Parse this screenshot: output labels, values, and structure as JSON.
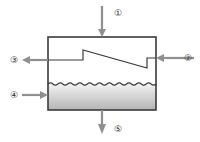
{
  "diagram": {
    "type": "process-flow-separator-vessel",
    "vessel": {
      "shape": "rectangle",
      "x": 48,
      "y": 37,
      "width": 108,
      "height": 73,
      "outline_color": "#3a3a3a",
      "outline_width": 1.6,
      "vapor_fill": "#ffffff",
      "liquid_fill_top": "#f2f2f2",
      "liquid_fill_bottom": "#b4b4b4"
    },
    "internal_baffle": {
      "name": "sloped-step-baffle",
      "color": "#3a3a3a",
      "width": 1.2,
      "points": "48,60 83,60 83,50 147,68 147,58 156,58"
    },
    "liquid_surface": {
      "name": "wavy-liquid-level-line",
      "color": "#3a3a3a",
      "y": 84,
      "wave_cycles": 11,
      "amplitude": 2.2
    },
    "arrow_color": "#8f8f8f",
    "arrow_width": 2.2,
    "streams": [
      {
        "id": "stream-1",
        "label": "①",
        "role": "feed-inlet-top",
        "direction": "down",
        "label_x": 118,
        "label_y": 13,
        "line": {
          "x1": 102,
          "y1": 6,
          "x2": 102,
          "y2": 35
        },
        "head": "102,37 98,29 106,29"
      },
      {
        "id": "stream-2",
        "label": "②",
        "role": "side-inlet-right",
        "direction": "left",
        "label_x": 188,
        "label_y": 58,
        "line": {
          "x1": 194,
          "y1": 58,
          "x2": 162,
          "y2": 58
        },
        "head": "156,58 164,54 164,62"
      },
      {
        "id": "stream-3",
        "label": "③",
        "role": "vapor-outlet-left",
        "direction": "left",
        "label_x": 14,
        "label_y": 60,
        "line": {
          "x1": 48,
          "y1": 60,
          "x2": 28,
          "y2": 60
        },
        "head": "22,60 30,56 30,64"
      },
      {
        "id": "stream-4",
        "label": "④",
        "role": "liquid-inlet-left",
        "direction": "right",
        "label_x": 14,
        "label_y": 95,
        "line": {
          "x1": 22,
          "y1": 95,
          "x2": 42,
          "y2": 95
        },
        "head": "48,95 40,91 40,99"
      },
      {
        "id": "stream-5",
        "label": "⑤",
        "role": "liquid-outlet-bottom",
        "direction": "down",
        "label_x": 118,
        "label_y": 129,
        "line": {
          "x1": 102,
          "y1": 110,
          "x2": 102,
          "y2": 126
        },
        "head": "102,134 98,124 106,124"
      }
    ]
  }
}
